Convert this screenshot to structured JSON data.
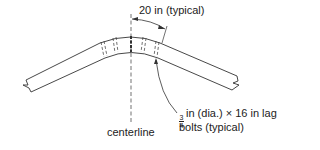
{
  "diagram": {
    "dimension_label": "20 in (typical)",
    "centerline_label": "centerline",
    "bolt_label": {
      "fraction_numerator": "3",
      "fraction_denominator": "4",
      "line1_rest": "in (dia.) × 16 in lag",
      "line2": "bolts (typical)"
    },
    "colors": {
      "line": "#333333",
      "background": "#ffffff"
    }
  }
}
